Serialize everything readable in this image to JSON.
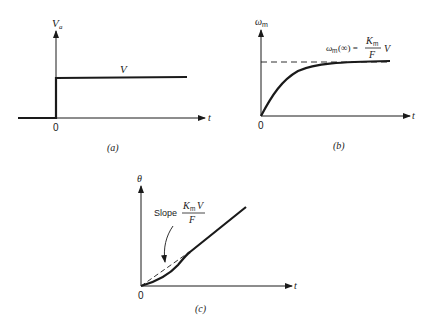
{
  "panels": {
    "a": {
      "caption": "(a)",
      "y_label": "V",
      "y_label_sub": "a",
      "x_label": "t",
      "origin_label": "0",
      "level_label": "V"
    },
    "b": {
      "caption": "(b)",
      "y_label": "ω",
      "y_label_sub": "m",
      "x_label": "t",
      "origin_label": "0",
      "asymptote_lhs": "ω",
      "asymptote_lhs_sub": "m",
      "asymptote_arg": "(∞) =",
      "asymptote_num": "K",
      "asymptote_num_sub": "m",
      "asymptote_den": "F",
      "asymptote_tail": "V"
    },
    "c": {
      "caption": "(c)",
      "y_label": "θ",
      "x_label": "t",
      "origin_label": "0",
      "slope_word": "Slope",
      "slope_num": "K",
      "slope_num_sub": "m",
      "slope_num_tail": "V",
      "slope_den": "F"
    }
  },
  "colors": {
    "ink": "#1a1a1a",
    "background": "#ffffff"
  }
}
